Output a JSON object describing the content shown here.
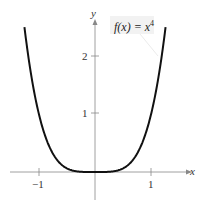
{
  "chart_data": {
    "type": "line",
    "title": "",
    "annotation": "f(x) = x^4",
    "function": "x^4",
    "xlabel": "x",
    "ylabel": "y",
    "xlim": [
      -1.5,
      1.5
    ],
    "ylim": [
      -0.5,
      2.6
    ],
    "x_ticks": [
      -1,
      1
    ],
    "y_ticks": [
      1,
      2
    ],
    "grid": false,
    "series": [
      {
        "name": "f(x) = x^4",
        "x": [
          -1.26,
          -1.2,
          -1.0,
          -0.8,
          -0.6,
          -0.4,
          -0.2,
          0,
          0.2,
          0.4,
          0.6,
          0.8,
          1.0,
          1.2,
          1.26
        ],
        "y": [
          2.52,
          2.07,
          1.0,
          0.41,
          0.13,
          0.026,
          0.0016,
          0,
          0.0016,
          0.026,
          0.13,
          0.41,
          1.0,
          2.07,
          2.52
        ]
      }
    ]
  },
  "labels": {
    "x_axis": "x",
    "y_axis": "y",
    "tick_neg1": "−1",
    "tick_1": "1",
    "ytick_1": "1",
    "ytick_2": "2",
    "fn_left": "f(x) = x",
    "fn_exp": "4"
  }
}
